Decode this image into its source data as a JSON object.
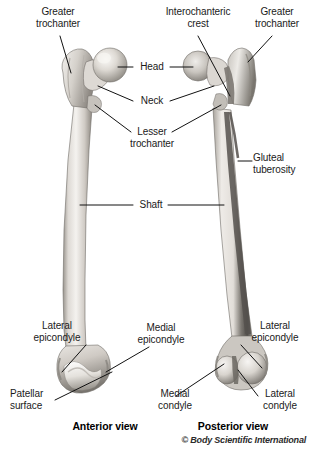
{
  "figure": {
    "background_color": "#ffffff",
    "width": 311,
    "height": 454,
    "credit": "© Body Scientific International",
    "view_labels": [
      {
        "key": "anterior",
        "text": "Anterior view"
      },
      {
        "key": "posterior",
        "text": "Posterior view"
      }
    ]
  },
  "labels": {
    "greater_trochanter_left": "Greater\ntrochanter",
    "interochanteric_crest": "Interochanteric\ncrest",
    "greater_trochanter_right": "Greater\ntrochanter",
    "head": "Head",
    "neck": "Neck",
    "lesser_trochanter": "Lesser\ntrochanter",
    "gluteal_tuberosity": "Gluteal\ntuberosity",
    "shaft": "Shaft",
    "lateral_epicondyle_left": "Lateral\nepicondyle",
    "medial_epicondyle": "Medial\nepicondyle",
    "lateral_epicondyle_right": "Lateral\nepicondyle",
    "patellar_surface": "Patellar\nsurface",
    "medial_condyle": "Medial\ncondyle",
    "lateral_condyle": "Lateral\ncondyle"
  },
  "colors": {
    "bone_light": "#f3f1ee",
    "bone_mid": "#d9d5d0",
    "bone_shadow": "#a8a29b",
    "bone_dark": "#6e6a65",
    "bone_darkest": "#46433f",
    "outline": "#6b6762",
    "leader_line": "#111111",
    "text": "#1a1a1a"
  },
  "structures": {
    "anterior": [
      "head",
      "neck",
      "greater-trochanter",
      "lesser-trochanter",
      "shaft",
      "lateral-epicondyle",
      "medial-epicondyle",
      "patellar-surface"
    ],
    "posterior": [
      "head",
      "neck",
      "greater-trochanter",
      "interochanteric-crest",
      "gluteal-tuberosity",
      "shaft",
      "lateral-epicondyle",
      "medial-epicondyle",
      "medial-condyle",
      "lateral-condyle"
    ]
  }
}
